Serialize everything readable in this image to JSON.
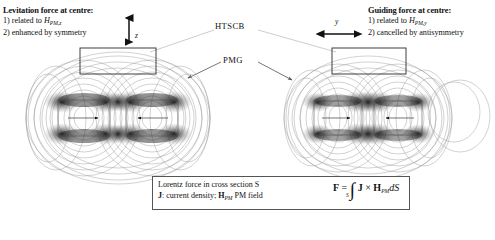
{
  "notes": {
    "left": {
      "heading": "Levitation force at centre:",
      "line1_pre": "1) related to ",
      "line1_sym": "H",
      "line1_sub": "PM,z",
      "line2": "2) enhanced by symmetry",
      "axis_label": "z",
      "axis_direction": "vertical"
    },
    "right": {
      "heading": "Guiding force at centre:",
      "line1_pre": "1) related to ",
      "line1_sym": "H",
      "line1_sub": "PM,y",
      "line2": "2) cancelled by antisymmetry",
      "axis_label": "y",
      "axis_direction": "horizontal"
    }
  },
  "labels": {
    "htscb": "HTSCB",
    "pmg": "PMG"
  },
  "formula": {
    "line1": "Lorentz force in cross section S",
    "line2_j": "J",
    "line2_mid": ": current density; ",
    "line2_h": "H",
    "line2_hsub": "PM",
    "line2_tail": "  PM field",
    "eq_F": "F",
    "eq_equals": " = ",
    "eq_integral": "∫",
    "eq_limit": "S",
    "eq_J": "J",
    "eq_cross": " × ",
    "eq_H": "H",
    "eq_Hsub": "PM",
    "eq_dS": "dS"
  },
  "plots": {
    "left": {
      "name": "symmetric-field-plot",
      "magnet_arrow_left": "right",
      "magnet_arrow_right": "left",
      "symmetry": "symmetric"
    },
    "right": {
      "name": "antisymmetric-field-plot",
      "magnet_arrow_left": "right",
      "magnet_arrow_right": "left",
      "symmetry": "antisymmetric"
    }
  },
  "colors": {
    "flux_line": "#9a9a9a",
    "magnet_outline": "#4a4a4a",
    "htsc_outline": "#2a2a2a",
    "text": "#111111"
  }
}
